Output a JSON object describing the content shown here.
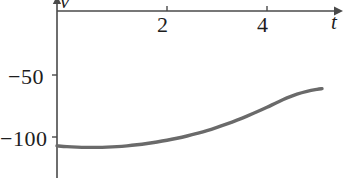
{
  "chart_data": {
    "type": "line",
    "title": "",
    "subtitle": "",
    "xlabel": "t",
    "ylabel": "v",
    "xlim": [
      0,
      5.7
    ],
    "ylim": [
      -115,
      5
    ],
    "grid": false,
    "legend": null,
    "axis_position": {
      "x_axis_at_y": 0,
      "y_axis_at_x": 0,
      "x_axis_arrow": true,
      "y_axis_arrow": true
    },
    "xticks": [
      2,
      4
    ],
    "xtick_labels": [
      "2",
      "4"
    ],
    "yticks": [
      -50,
      -100
    ],
    "ytick_labels": [
      "−50",
      "−100"
    ],
    "series": [
      {
        "name": "v(t)",
        "color": "#6a6a6a",
        "x": [
          0.0,
          0.2,
          0.4,
          0.6,
          0.8,
          1.0,
          1.2,
          1.4,
          1.6,
          1.8,
          2.0,
          2.2,
          2.4,
          2.6,
          2.8,
          3.0,
          3.2,
          3.4,
          3.6,
          3.8,
          4.0,
          4.2,
          4.4,
          4.6,
          4.8,
          5.0,
          5.2,
          5.3
        ],
        "y": [
          -107.0,
          -107.6,
          -108.0,
          -108.2,
          -108.2,
          -108.0,
          -107.6,
          -107.0,
          -106.2,
          -105.2,
          -104.0,
          -102.6,
          -101.0,
          -99.2,
          -97.2,
          -95.0,
          -92.4,
          -89.6,
          -86.6,
          -83.4,
          -80.0,
          -76.4,
          -72.6,
          -69.0,
          -66.0,
          -63.8,
          -62.2,
          -61.6
        ]
      }
    ]
  },
  "labels": {
    "xtick_2": "2",
    "xtick_4": "4",
    "ytick_50": "−50",
    "ytick_100": "−100",
    "xaxis_name": "t",
    "yaxis_name": "v"
  },
  "colors": {
    "curve": "#6a6a6a",
    "axis": "#4a4a4a",
    "text": "#1d1d1d",
    "background": "#ffffff"
  }
}
